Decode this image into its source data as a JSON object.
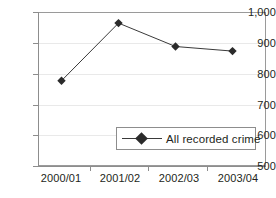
{
  "chart_data": {
    "type": "line",
    "title": "",
    "xlabel": "",
    "ylabel": "",
    "categories": [
      "2000/01",
      "2001/02",
      "2002/03",
      "2003/04"
    ],
    "series": [
      {
        "name": "All recorded crime",
        "values": [
          777,
          964,
          888,
          873
        ],
        "marker": "diamond",
        "color": "#2b2b2b"
      }
    ],
    "ylim": [
      500,
      1000
    ],
    "yticks": [
      500,
      600,
      700,
      800,
      900,
      1000
    ],
    "ytick_labels": [
      "500",
      "600",
      "700",
      "800",
      "900",
      "1,000"
    ],
    "grid": true,
    "legend_position": "inside-bottom-right"
  },
  "axes": {
    "y_labels": [
      "1,000",
      "900",
      "800",
      "700",
      "600",
      "500"
    ],
    "x_labels": [
      "2000/01",
      "2001/02",
      "2002/03",
      "2003/04"
    ]
  },
  "legend": {
    "entries": [
      {
        "label": "All recorded crime",
        "marker_icon": "diamond-marker-icon"
      }
    ]
  },
  "colors": {
    "series": "#2b2b2b",
    "axis": "#8d8d8d",
    "grid": "#e9e9e9",
    "text": "#231f20",
    "background": "#ffffff"
  }
}
